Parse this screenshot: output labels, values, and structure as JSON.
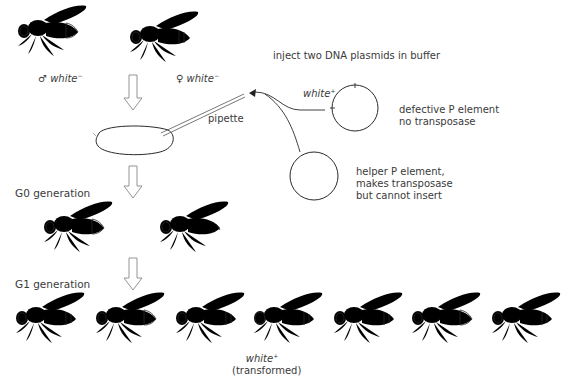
{
  "parents": {
    "male_label_symbol": "♂",
    "male_label": "white",
    "male_sup": "−",
    "female_label_symbol": "♀",
    "female_label": "white",
    "female_sup": "−"
  },
  "injection": {
    "instruction": "inject two DNA plasmids in buffer",
    "pipette_label": "pipette",
    "plasmid1": {
      "gene_label": "white",
      "gene_sup": "+",
      "desc_line1": "defective P element",
      "desc_line2": "no transposase"
    },
    "plasmid2": {
      "desc_line1": "helper P element,",
      "desc_line2": "makes transposase",
      "desc_line3": "but cannot insert"
    }
  },
  "generations": {
    "g0_label": "G0 generation",
    "g1_label": "G1 generation"
  },
  "g1_flies": [
    {
      "eye": "white"
    },
    {
      "eye": "white"
    },
    {
      "eye": "white"
    },
    {
      "eye": "red",
      "label": "white",
      "sup": "+",
      "note": "(transformed)"
    },
    {
      "eye": "white"
    },
    {
      "eye": "white"
    },
    {
      "eye": "white"
    }
  ],
  "colors": {
    "line": "#2a2a2a",
    "text": "#3a3a3a",
    "arrow": "#888888",
    "pigment_eye": "#111111"
  }
}
